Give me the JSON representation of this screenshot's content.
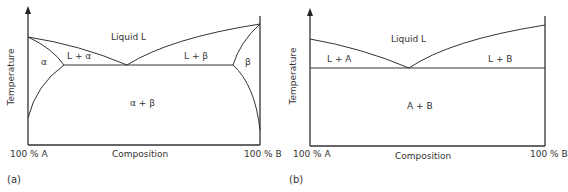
{
  "panels": [
    {
      "tag": "(a)",
      "ylabel": "Temperature",
      "xlabel": "Composition",
      "x_left": "100 % A",
      "x_right": "100 % B",
      "regions": {
        "liquid": "Liquid L",
        "l_alpha": "L + α",
        "l_beta": "L + β",
        "alpha": "α",
        "beta": "β",
        "alpha_beta": "α + β"
      }
    },
    {
      "tag": "(b)",
      "ylabel": "Temperature",
      "xlabel": "Composition",
      "x_left": "100 % A",
      "x_right": "100 % B",
      "regions": {
        "liquid": "Liquid L",
        "l_a": "L + A",
        "l_b": "L + B",
        "a_b": "A + B"
      }
    }
  ],
  "colors": {
    "line": "#333333",
    "text": "#333333"
  }
}
